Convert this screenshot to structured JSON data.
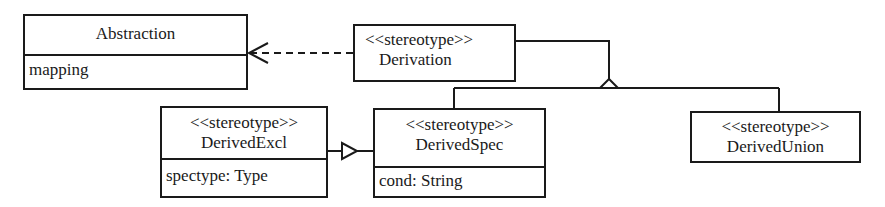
{
  "diagram": {
    "type": "UML class diagram",
    "classes": [
      {
        "id": "abstraction",
        "stereotype": "",
        "name": "Abstraction",
        "attributes": [
          "mapping"
        ]
      },
      {
        "id": "derivation",
        "stereotype": "<<stereotype>>",
        "name": "Derivation",
        "attributes": []
      },
      {
        "id": "derived_excl",
        "stereotype": "<<stereotype>>",
        "name": "DerivedExcl",
        "attributes": [
          "spectype: Type"
        ]
      },
      {
        "id": "derived_spec",
        "stereotype": "<<stereotype>>",
        "name": "DerivedSpec",
        "attributes": [
          "cond: String"
        ]
      },
      {
        "id": "derived_union",
        "stereotype": "<<stereotype>>",
        "name": "DerivedUnion",
        "attributes": []
      }
    ],
    "relations": [
      {
        "from": "Derivation",
        "to": "Abstraction",
        "kind": "dependency (dashed, open arrow)"
      },
      {
        "from": "DerivedSpec",
        "to": "Derivation",
        "kind": "generalization"
      },
      {
        "from": "DerivedUnion",
        "to": "Derivation",
        "kind": "generalization"
      },
      {
        "from": "DerivedSpec",
        "to": "DerivedExcl",
        "kind": "generalization"
      }
    ],
    "colors": {
      "line": "#1a1a1a",
      "background": "#ffffff"
    }
  }
}
